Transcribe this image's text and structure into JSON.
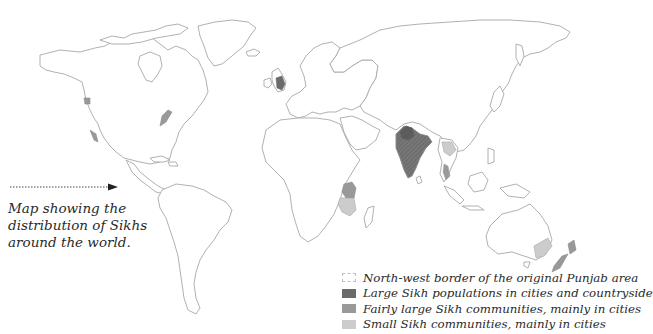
{
  "map": {
    "title": "Map showing the distribution of Sikhs around the world.",
    "caption_lines": [
      "Map showing the",
      "distribution of Sikhs",
      "around the world."
    ],
    "colors": {
      "outline": "#a8a8a8",
      "large": "#6b6b6b",
      "fairly_large": "#999999",
      "small": "#cccccc",
      "punjab_border": "#bdbdbd"
    },
    "legend": [
      {
        "key": "punjab_border",
        "label": "North-west border of the original Punjab area"
      },
      {
        "key": "large",
        "label": "Large Sikh populations in cities and countryside"
      },
      {
        "key": "fairly_large",
        "label": "Fairly large Sikh communities, mainly in cities"
      },
      {
        "key": "small",
        "label": "Small Sikh communities, mainly in cities"
      }
    ],
    "highlighted_regions": [
      {
        "region": "Punjab / North India",
        "category": "large"
      },
      {
        "region": "India",
        "category": "fairly_large"
      },
      {
        "region": "United Kingdom",
        "category": "fairly_large"
      },
      {
        "region": "Kenya / Uganda",
        "category": "fairly_large"
      },
      {
        "region": "Tanzania",
        "category": "small"
      },
      {
        "region": "British Columbia (Canada)",
        "category": "fairly_large"
      },
      {
        "region": "California (USA)",
        "category": "fairly_large"
      },
      {
        "region": "US/Canada East Coast",
        "category": "fairly_large"
      },
      {
        "region": "Thailand",
        "category": "small"
      },
      {
        "region": "Malaysia / Singapore",
        "category": "fairly_large"
      },
      {
        "region": "South-east Australia",
        "category": "small"
      },
      {
        "region": "New Zealand",
        "category": "fairly_large"
      }
    ]
  }
}
